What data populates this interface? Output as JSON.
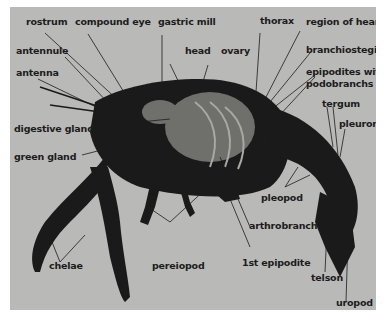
{
  "figure": {
    "background_color": "#b9b9b7",
    "body_color": "#1a1a1a",
    "labels": {
      "rostrum": "rostrum",
      "compound_eye": "compound eye",
      "gastric_mill": "gastric mill",
      "thorax": "thorax",
      "region_of_heart": "region of heart",
      "antennule": "antennule",
      "head": "head",
      "ovary": "ovary",
      "branchiostegite": "branchiostegite",
      "antenna": "antenna",
      "epipodites_1": "epipodites with",
      "epipodites_2": "podobranchs",
      "tergum": "tergum",
      "pleuron": "pleuron",
      "digestive_gland": "digestive gland",
      "green_gland": "green gland",
      "pleopod": "pleopod",
      "arthrobranch": "arthrobranch",
      "chelae": "chelae",
      "pereiopod": "pereiopod",
      "first_epipodite": "1st epipodite",
      "telson": "telson",
      "uropod": "uropod"
    }
  }
}
